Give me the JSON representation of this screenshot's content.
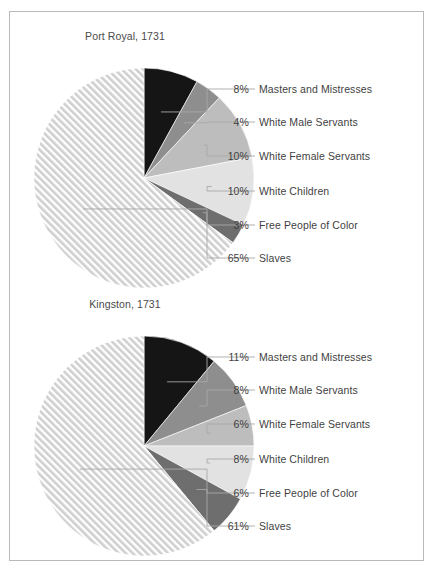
{
  "figure": {
    "background": "#ffffff",
    "frame_color": "#b9b9b9",
    "leader_line_color": "#a8a8a8",
    "text_color": "#3f3f3f"
  },
  "chart_data": [
    {
      "type": "pie",
      "title": "Port Royal, 1731",
      "xlabel": "",
      "ylabel": "",
      "legend_position": "right-with-leader-lines",
      "grid": false,
      "categories": [
        "Masters and Mistresses",
        "White Male Servants",
        "White Female Servants",
        "White Children",
        "Free People of Color",
        "Slaves"
      ],
      "values": [
        8,
        4,
        10,
        10,
        3,
        65
      ],
      "value_labels": [
        "8%",
        "4%",
        "10%",
        "10%",
        "3%",
        "65%"
      ],
      "colors": [
        "#151515",
        "#8e8e8e",
        "#bdbdbd",
        "#e2e2e2",
        "#6e6e6e",
        "#cfcfcf"
      ],
      "slice_fills": [
        "solid",
        "solid",
        "solid",
        "solid",
        "solid",
        "hatch-diagonal"
      ],
      "start_angle_deg": 0,
      "direction": "clockwise"
    },
    {
      "type": "pie",
      "title": "Kingston, 1731",
      "xlabel": "",
      "ylabel": "",
      "legend_position": "right-with-leader-lines",
      "grid": false,
      "categories": [
        "Masters and Mistresses",
        "White Male Servants",
        "White Female Servants",
        "White Children",
        "Free People of Color",
        "Slaves"
      ],
      "values": [
        11,
        8,
        6,
        8,
        6,
        61
      ],
      "value_labels": [
        "11%",
        "8%",
        "6%",
        "8%",
        "6%",
        "61%"
      ],
      "colors": [
        "#151515",
        "#8e8e8e",
        "#bdbdbd",
        "#e2e2e2",
        "#6e6e6e",
        "#cfcfcf"
      ],
      "slice_fills": [
        "solid",
        "solid",
        "solid",
        "solid",
        "solid",
        "hatch-diagonal"
      ],
      "start_angle_deg": 0,
      "direction": "clockwise"
    }
  ]
}
